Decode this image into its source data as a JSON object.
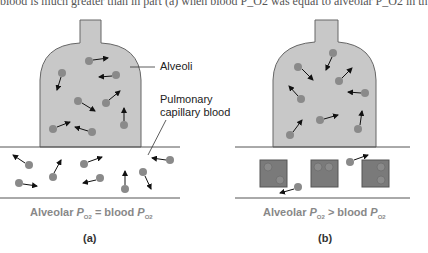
{
  "top_text": "blood is much greater than in part (a) when blood P_O2 was equal to alveolar P_O2 in th",
  "labels": {
    "alveoli": "Alveoli",
    "pulmonary_line1": "Pulmonary",
    "pulmonary_line2": "capillary blood"
  },
  "captions": {
    "a": {
      "left": "Alveolar ",
      "p": "P",
      "sub": "O2",
      "mid": " = blood ",
      "p2": "P",
      "sub2": "O2",
      "panel": "(a)"
    },
    "b": {
      "left": "Alveolar ",
      "p": "P",
      "sub": "O2",
      "mid": " > blood ",
      "p2": "P",
      "sub2": "O2",
      "panel": "(b)"
    }
  },
  "colors": {
    "alveolus_fill": "#c8c8c8",
    "molecule": "#8a8a8a",
    "hemoglobin_box": "#7a7a7a",
    "line": "#555555"
  }
}
